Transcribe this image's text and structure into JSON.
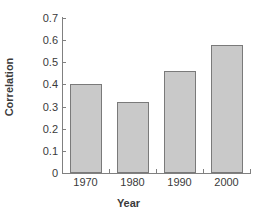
{
  "chart_data": {
    "type": "bar",
    "title": "",
    "xlabel": "Year",
    "ylabel": "Correlation",
    "categories": [
      "1970",
      "1980",
      "1990",
      "2000"
    ],
    "values": [
      0.4,
      0.32,
      0.46,
      0.58
    ],
    "ylim": [
      0,
      0.7
    ],
    "yticks": [
      "0",
      "0.1",
      "0.2",
      "0.3",
      "0.4",
      "0.5",
      "0.6",
      "0.7"
    ],
    "ytick_values": [
      0,
      0.1,
      0.2,
      0.3,
      0.4,
      0.5,
      0.6,
      0.7
    ],
    "grid": false,
    "legend": null,
    "bar_color": "#c9c9c9",
    "bar_border_color": "#7a7a7a",
    "axis_color": "#808080",
    "text_color": "#3a3a3a",
    "background": "#ffffff"
  }
}
